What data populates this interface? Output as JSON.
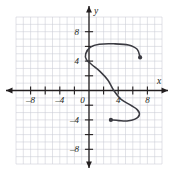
{
  "figure": {
    "title": "",
    "background_color": "#ffffff"
  },
  "chart_data": {
    "type": "line",
    "title": "",
    "xlabel": "x",
    "ylabel": "y",
    "xlim": [
      -10,
      10
    ],
    "ylim": [
      -10,
      10
    ],
    "grid": true,
    "grid_step": 1,
    "grid_color": "#c9ccd4",
    "axis_color": "#231f20",
    "curve_color": "#3b3b42",
    "legend": null,
    "xticks": [
      -8,
      -4,
      0,
      4,
      8
    ],
    "xtick_labels": [
      "–8",
      "–4",
      "0",
      "4",
      "8"
    ],
    "yticks": [
      8,
      4,
      -4,
      -8
    ],
    "ytick_labels": [
      "8",
      "4",
      "–4",
      "–8"
    ],
    "minor_tick_step": 2,
    "series": [
      {
        "name": "s-curve",
        "kind": "open-curve",
        "closed": false,
        "points": [
          [
            7.0,
            4.5
          ],
          [
            6.6,
            5.6
          ],
          [
            5.4,
            6.2
          ],
          [
            3.4,
            6.35
          ],
          [
            1.4,
            6.3
          ],
          [
            0.2,
            5.9
          ],
          [
            -0.45,
            5.0
          ],
          [
            -0.35,
            4.2
          ],
          [
            0.4,
            3.5
          ],
          [
            1.5,
            2.6
          ],
          [
            2.6,
            1.4
          ],
          [
            3.4,
            0.0
          ],
          [
            4.4,
            -1.2
          ],
          [
            5.7,
            -2.0
          ],
          [
            6.6,
            -2.6
          ],
          [
            6.9,
            -3.3
          ],
          [
            6.3,
            -3.9
          ],
          [
            5.2,
            -4.15
          ],
          [
            4.1,
            -4.1
          ],
          [
            3.0,
            -4.0
          ]
        ],
        "endpoints": [
          {
            "label": "upper-right-endpoint",
            "x": 7.0,
            "y": 4.5,
            "style": "filled-dot"
          },
          {
            "label": "lower-left-endpoint",
            "x": 3.0,
            "y": -4.0,
            "style": "filled-dot"
          }
        ]
      }
    ],
    "annotations": []
  },
  "axes": {
    "x_axis_label": "x",
    "y_axis_label": "y",
    "x_arrow_left": true,
    "x_arrow_right": true,
    "y_arrow_up": true,
    "y_arrow_down": true
  }
}
